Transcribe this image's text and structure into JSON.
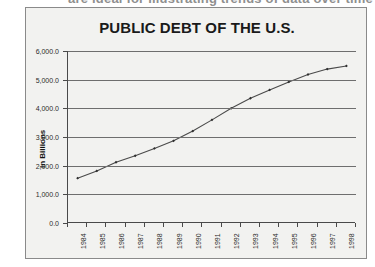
{
  "caption": {
    "text": "are ideal for illustrating trends of data over time"
  },
  "chart": {
    "title": "PUBLIC DEBT OF THE U.S.",
    "y_axis_title": "In Billions"
  },
  "chart_data": {
    "type": "line",
    "title": "PUBLIC DEBT OF THE U.S.",
    "xlabel": "",
    "ylabel": "In Billions",
    "categories": [
      "1984",
      "1985",
      "1986",
      "1987",
      "1988",
      "1989",
      "1990",
      "1991",
      "1992",
      "1993",
      "1994",
      "1995",
      "1996",
      "1997",
      "1998"
    ],
    "values": [
      1565,
      1817,
      2120,
      2346,
      2601,
      2868,
      3206,
      3598,
      4002,
      4351,
      4643,
      4921,
      5181,
      5369,
      5478
    ],
    "ytick_labels": [
      "0.0",
      "1,000.0",
      "2,000.0",
      "3,000.0",
      "4,000.0",
      "5,000.0",
      "6,000.0"
    ],
    "ytick_values": [
      0,
      1000,
      2000,
      3000,
      4000,
      5000,
      6000
    ],
    "ylim": [
      0,
      6000
    ],
    "grid": true,
    "legend": false,
    "marker": "diamond",
    "line_color": "#4a4a4a",
    "grid_color": "#6e6e6e",
    "plot_background": "#f2f2f0"
  }
}
